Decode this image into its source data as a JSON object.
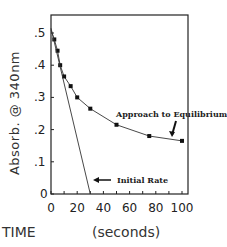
{
  "chart_data": {
    "type": "line",
    "title": "",
    "xlabel": "TIME",
    "xlabel_units": "(seconds)",
    "ylabel": "Absorb. @ 340nm",
    "xlim": [
      0,
      100
    ],
    "ylim": [
      0,
      0.55
    ],
    "x_ticks": [
      "0",
      "20",
      "40",
      "60",
      "80",
      "100"
    ],
    "y_ticks": [
      "0",
      ".1",
      ".2",
      ".3",
      ".4",
      ".5"
    ],
    "grid": false,
    "series": [
      {
        "name": "Approach to Equilibrium",
        "marker": "square",
        "x": [
          0,
          2.5,
          5,
          7,
          10,
          15,
          20,
          30,
          50,
          75,
          100
        ],
        "y": [
          0.51,
          0.48,
          0.445,
          0.4,
          0.365,
          0.335,
          0.3,
          0.265,
          0.215,
          0.18,
          0.165
        ]
      },
      {
        "name": "Initial Rate",
        "marker": "none",
        "x": [
          0,
          30
        ],
        "y": [
          0.515,
          0.0
        ]
      }
    ],
    "annotations": [
      {
        "text": "Approach to Equilibrium",
        "points_to": "curve near t=90"
      },
      {
        "text": "Initial Rate",
        "points_to": "tangent line at t=30"
      }
    ]
  },
  "labels": {
    "ylabel": "Absorb. @ 340nm",
    "xlabel": "TIME",
    "xunits": "(seconds)",
    "ann_equilibrium": "Approach to Equilibrium",
    "ann_initial": "Initial Rate",
    "xticks": [
      "0",
      "20",
      "40",
      "60",
      "80",
      "100"
    ],
    "yticks": [
      "0",
      ".1",
      ".2",
      ".3",
      ".4",
      ".5"
    ]
  }
}
